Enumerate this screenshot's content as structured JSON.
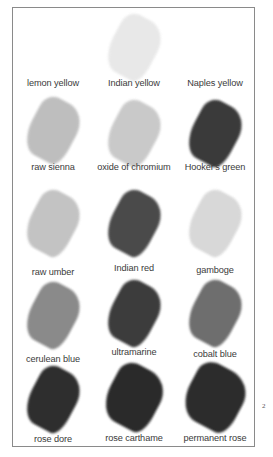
{
  "page_number": "2",
  "swatches": [
    {
      "label": "lemon yellow",
      "color": "#ffffff",
      "opacity": 0
    },
    {
      "label": "Indian yellow",
      "color": "#e6e6e6",
      "opacity": 0.9
    },
    {
      "label": "Naples yellow",
      "color": "#ffffff",
      "opacity": 0
    },
    {
      "label": "raw sienna",
      "color": "#b8b8b8",
      "opacity": 0.9
    },
    {
      "label": "oxide of chromium",
      "color": "#c4c4c4",
      "opacity": 0.9
    },
    {
      "label": "Hooker's green",
      "color": "#3a3a3a",
      "opacity": 1
    },
    {
      "label": "raw umber",
      "color": "#bdbdbd",
      "opacity": 0.9
    },
    {
      "label": "Indian red",
      "color": "#4a4a4a",
      "opacity": 1
    },
    {
      "label": "gamboge",
      "color": "#d4d4d4",
      "opacity": 0.9
    },
    {
      "label": "cerulean blue",
      "color": "#8a8a8a",
      "opacity": 1
    },
    {
      "label": "ultramarine",
      "color": "#3c3c3c",
      "opacity": 1
    },
    {
      "label": "cobalt blue",
      "color": "#6e6e6e",
      "opacity": 1
    },
    {
      "label": "rose dore",
      "color": "#2e2e2e",
      "opacity": 1
    },
    {
      "label": "rose carthame",
      "color": "#2a2a2a",
      "opacity": 1
    },
    {
      "label": "permanent rose",
      "color": "#2c2c2c",
      "opacity": 1
    }
  ]
}
